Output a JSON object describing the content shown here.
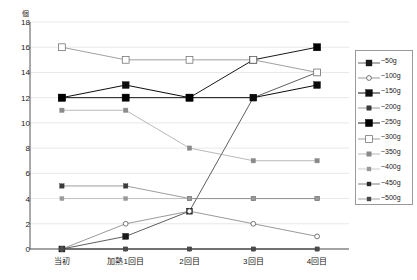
{
  "chart_data": {
    "type": "line",
    "title": "",
    "subtitle": "",
    "xlabel": "",
    "ylabel": "個",
    "yunit": "個",
    "categories": [
      "当初",
      "加熱1回目",
      "2回目",
      "3回目",
      "4回目"
    ],
    "ylim": [
      0,
      18
    ],
    "yticks": [
      0,
      2,
      4,
      6,
      8,
      10,
      12,
      14,
      16,
      18
    ],
    "grid": true,
    "legend_position": "right",
    "series": [
      {
        "name": "~50g",
        "values": [
          0,
          1,
          3,
          12,
          14
        ],
        "marker": "filled-square",
        "color": "#1a1a1a",
        "size": 3.0,
        "lw": 0.7
      },
      {
        "name": "~100g",
        "values": [
          0,
          2,
          3,
          2,
          1
        ],
        "marker": "open-circle",
        "color": "#555555",
        "size": 3.0,
        "lw": 0.6
      },
      {
        "name": "~150g",
        "values": [
          12,
          13,
          12,
          12,
          13
        ],
        "marker": "filled-square",
        "color": "#0d0d0d",
        "size": 3.4,
        "lw": 1.0
      },
      {
        "name": "~200g",
        "values": [
          5,
          5,
          4,
          4,
          4
        ],
        "marker": "filled-square",
        "color": "#3a3a3a",
        "size": 2.2,
        "lw": 0.5
      },
      {
        "name": "~250g",
        "values": [
          12,
          12,
          12,
          15,
          16
        ],
        "marker": "filled-square",
        "color": "#000000",
        "size": 3.6,
        "lw": 0.9
      },
      {
        "name": "~300g",
        "values": [
          16,
          15,
          15,
          15,
          14
        ],
        "marker": "open-square",
        "color": "#777777",
        "size": 3.4,
        "lw": 0.7
      },
      {
        "name": "~350g",
        "values": [
          11,
          11,
          8,
          7,
          7
        ],
        "marker": "filled-square",
        "color": "#8a8a8a",
        "size": 2.2,
        "lw": 0.6
      },
      {
        "name": "~400g",
        "values": [
          4,
          4,
          4,
          4,
          4
        ],
        "marker": "filled-square",
        "color": "#9a9a9a",
        "size": 2.0,
        "lw": 0.5
      },
      {
        "name": "~450g",
        "values": [
          0,
          0,
          0,
          0,
          0
        ],
        "marker": "filled-square",
        "color": "#2a2a2a",
        "size": 2.0,
        "lw": 0.6
      },
      {
        "name": "~500g",
        "values": [
          0,
          0,
          0,
          0,
          0
        ],
        "marker": "filled-square",
        "color": "#4a4a4a",
        "size": 2.0,
        "lw": 0.5
      }
    ]
  },
  "legend": {
    "items": [
      {
        "label": "~50g"
      },
      {
        "label": "~100g"
      },
      {
        "label": "~150g"
      },
      {
        "label": "~200g"
      },
      {
        "label": "~250g"
      },
      {
        "label": "~300g"
      },
      {
        "label": "~350g"
      },
      {
        "label": "~400g"
      },
      {
        "label": "~450g"
      },
      {
        "label": "~500g"
      }
    ]
  }
}
